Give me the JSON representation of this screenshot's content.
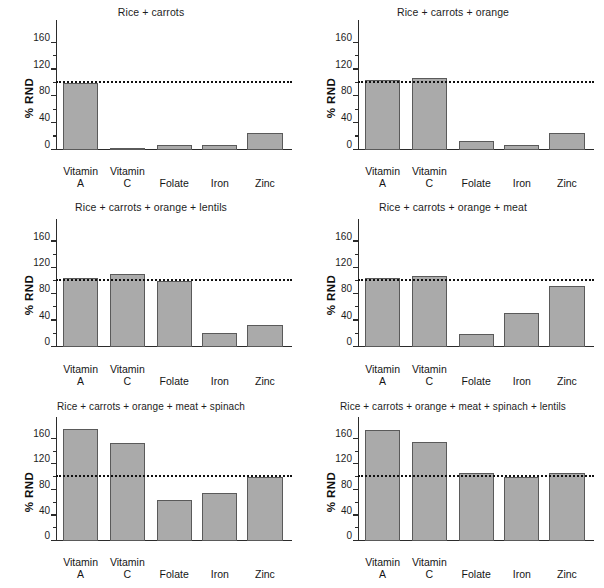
{
  "figure": {
    "ylabel": "% RND",
    "categories": [
      "Vitamin\nA",
      "Vitamin\nC",
      "Folate",
      "Iron",
      "Zinc"
    ],
    "yticks": [
      0,
      40,
      80,
      120,
      160
    ],
    "ytick_labels": [
      "0",
      "40",
      "80",
      "120",
      "160"
    ],
    "yminor": [
      20,
      60,
      100,
      140
    ],
    "ylim": [
      0,
      185
    ],
    "reference_line": 100,
    "bar_color": "#aaaaaa",
    "bar_edge_color": "#5a5a5a",
    "axis_color": "#2b2b2b"
  },
  "chart_data": [
    {
      "type": "bar",
      "title": "Rice + carrots",
      "xlabel": "",
      "ylabel": "% RND",
      "categories": [
        "Vitamin A",
        "Vitamin C",
        "Folate",
        "Iron",
        "Zinc"
      ],
      "values": [
        100,
        3,
        7,
        8,
        25
      ],
      "ylim": [
        0,
        185
      ],
      "yticks": [
        0,
        40,
        80,
        120,
        160
      ],
      "reference_line": 100,
      "grid": false,
      "legend": "none"
    },
    {
      "type": "bar",
      "title": "Rice + carrots + orange",
      "xlabel": "",
      "ylabel": "% RND",
      "categories": [
        "Vitamin A",
        "Vitamin C",
        "Folate",
        "Iron",
        "Zinc"
      ],
      "values": [
        105,
        108,
        14,
        7,
        25
      ],
      "ylim": [
        0,
        185
      ],
      "yticks": [
        0,
        40,
        80,
        120,
        160
      ],
      "reference_line": 100,
      "grid": false,
      "legend": "none"
    },
    {
      "type": "bar",
      "title": "Rice + carrots + orange + lentils",
      "xlabel": "",
      "ylabel": "% RND",
      "categories": [
        "Vitamin A",
        "Vitamin C",
        "Folate",
        "Iron",
        "Zinc"
      ],
      "values": [
        105,
        111,
        100,
        21,
        33
      ],
      "ylim": [
        0,
        185
      ],
      "yticks": [
        0,
        40,
        80,
        120,
        160
      ],
      "reference_line": 100,
      "grid": false,
      "legend": "none"
    },
    {
      "type": "bar",
      "title": "Rice + carrots + orange + meat",
      "xlabel": "",
      "ylabel": "% RND",
      "categories": [
        "Vitamin A",
        "Vitamin C",
        "Folate",
        "Iron",
        "Zinc"
      ],
      "values": [
        105,
        108,
        19,
        52,
        93
      ],
      "ylim": [
        0,
        185
      ],
      "yticks": [
        0,
        40,
        80,
        120,
        160
      ],
      "reference_line": 100,
      "grid": false,
      "legend": "none"
    },
    {
      "type": "bar",
      "title": "Rice + carrots + orange + meat + spinach",
      "xlabel": "",
      "ylabel": "% RND",
      "categories": [
        "Vitamin A",
        "Vitamin C",
        "Folate",
        "Iron",
        "Zinc"
      ],
      "values": [
        175,
        153,
        65,
        76,
        100
      ],
      "ylim": [
        0,
        185
      ],
      "yticks": [
        0,
        40,
        80,
        120,
        160
      ],
      "reference_line": 100,
      "grid": false,
      "legend": "none"
    },
    {
      "type": "bar",
      "title": "Rice + carrots + orange + meat + spinach + lentils",
      "xlabel": "",
      "ylabel": "% RND",
      "categories": [
        "Vitamin A",
        "Vitamin C",
        "Folate",
        "Iron",
        "Zinc"
      ],
      "values": [
        174,
        155,
        107,
        100,
        106
      ],
      "ylim": [
        0,
        185
      ],
      "yticks": [
        0,
        40,
        80,
        120,
        160
      ],
      "reference_line": 100,
      "grid": false,
      "legend": "none"
    }
  ]
}
